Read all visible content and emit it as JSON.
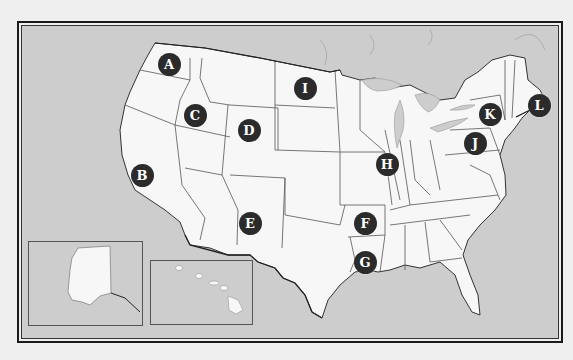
{
  "map": {
    "title": "United States outline map with lettered markers",
    "colors": {
      "ocean": "#cdcdcd",
      "land": "#f7f7f7",
      "border": "#555555",
      "marker_fill": "#2b2b2b",
      "marker_text": "#ffffff"
    },
    "markers": [
      {
        "label": "A",
        "x": 169,
        "y": 64
      },
      {
        "label": "B",
        "x": 142,
        "y": 175
      },
      {
        "label": "C",
        "x": 195,
        "y": 115
      },
      {
        "label": "D",
        "x": 249,
        "y": 130
      },
      {
        "label": "E",
        "x": 250,
        "y": 223
      },
      {
        "label": "F",
        "x": 365,
        "y": 223
      },
      {
        "label": "G",
        "x": 365,
        "y": 262
      },
      {
        "label": "H",
        "x": 387,
        "y": 164
      },
      {
        "label": "I",
        "x": 305,
        "y": 88
      },
      {
        "label": "J",
        "x": 475,
        "y": 143
      },
      {
        "label": "K",
        "x": 490,
        "y": 114
      },
      {
        "label": "L",
        "x": 539,
        "y": 105
      }
    ],
    "insets": [
      {
        "name": "Alaska"
      },
      {
        "name": "Hawaii"
      }
    ]
  }
}
